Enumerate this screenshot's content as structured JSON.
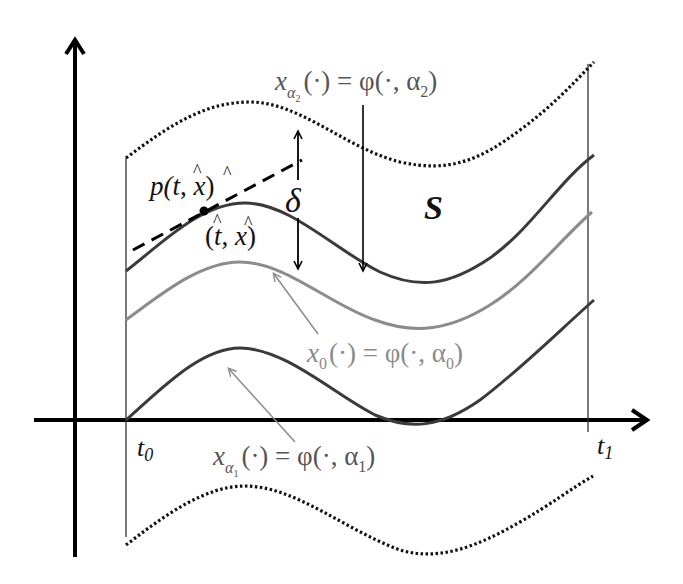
{
  "diagram": {
    "type": "solution-funnel",
    "colors": {
      "axis": "#000000",
      "dark_curve": "#3a3a3a",
      "gray_curve": "#8c8c8c",
      "dotted_bound": "#111111",
      "gray_label": "#7a7a7a",
      "background": "#ffffff"
    },
    "axes": {
      "t0_label": "t",
      "t0_sub": "0",
      "t1_label": "t",
      "t1_sub": "1"
    },
    "region_label": "S",
    "delta_label": "δ",
    "tangent_label": {
      "p": "p(",
      "t": "t",
      "comma": ", ",
      "x": "x",
      "close": ")",
      "hat": "^"
    },
    "point_label": {
      "open": "(",
      "t": "t",
      "comma": ", ",
      "x": "x",
      "close": ")",
      "hat": "^"
    },
    "curves": {
      "upper_label": {
        "x": "x",
        "sub": "α",
        "subsub": "2",
        "rest": "(·) = φ(·, α",
        "rest_sub": "2",
        "close": ")"
      },
      "middle_label": {
        "x": "x",
        "sub": "0",
        "rest": "(·) = φ(·, α",
        "rest_sub": "0",
        "close": ")"
      },
      "lower_label": {
        "x": "x",
        "sub": "α",
        "subsub": "1",
        "rest": "(·) = φ(·, α",
        "rest_sub": "1",
        "close": ")"
      }
    }
  }
}
